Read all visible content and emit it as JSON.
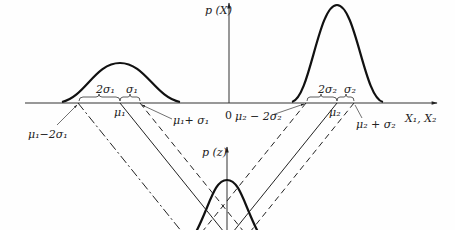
{
  "figure": {
    "type": "diagram",
    "axes": {
      "x_label": "X₁, X₂",
      "px_label": "p (X)",
      "pz_label": "p (z)",
      "origin_label": "0"
    },
    "distribution_1": {
      "brace_2sigma": "2σ₁",
      "brace_sigma": "σ₁",
      "mean_label": "μ₁",
      "minus_2sigma_label": "μ₁−2σ₁",
      "plus_sigma_label": "μ₁+ σ₁"
    },
    "distribution_2": {
      "brace_2sigma": "2σ₂",
      "brace_sigma": "σ₂",
      "mean_label": "μ₂",
      "minus_2sigma_label": "μ₂ − 2σ₂",
      "plus_sigma_label": "μ₂ + σ₂"
    },
    "colors": {
      "ink": "#222222",
      "background": "#fefefe"
    }
  }
}
